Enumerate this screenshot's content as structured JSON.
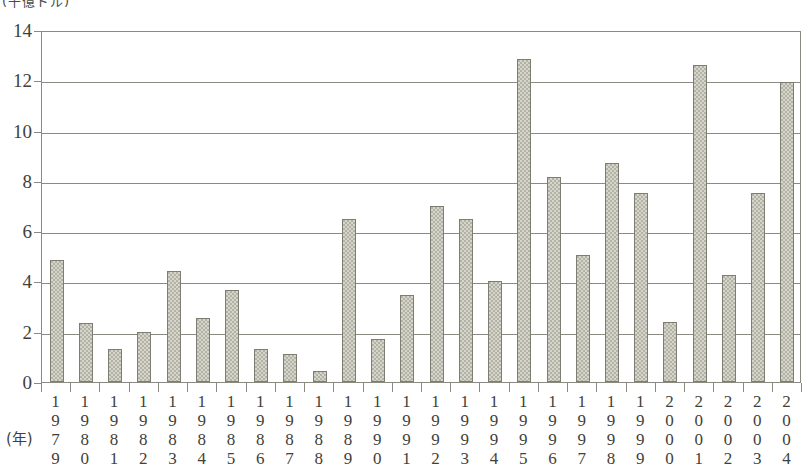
{
  "chart_data": {
    "type": "bar",
    "title": "(千億ドル)",
    "xlabel": "(年)",
    "ylabel": "",
    "ylim": [
      0,
      14
    ],
    "yticks": [
      0,
      2,
      4,
      6,
      8,
      10,
      12,
      14
    ],
    "grid": true,
    "legend": "none",
    "categories": [
      "1979",
      "1980",
      "1981",
      "1982",
      "1983",
      "1984",
      "1985",
      "1986",
      "1987",
      "1988",
      "1989",
      "1990",
      "1991",
      "1992",
      "1993",
      "1994",
      "1995",
      "1996",
      "1997",
      "1998",
      "1999",
      "2000",
      "2001",
      "2002",
      "2003",
      "2004"
    ],
    "values": [
      4.85,
      2.35,
      1.3,
      2.0,
      4.4,
      2.55,
      3.65,
      1.3,
      1.1,
      0.45,
      6.5,
      1.7,
      3.45,
      7.0,
      6.5,
      4.0,
      12.85,
      8.15,
      5.05,
      8.7,
      7.5,
      2.4,
      12.6,
      4.25,
      7.5,
      11.95
    ]
  },
  "axis": {
    "y_tick_labels": [
      "0",
      "2",
      "4",
      "6",
      "8",
      "10",
      "12",
      "14"
    ],
    "year_caption": "(年)",
    "unit_caption": "(千億ドル)"
  }
}
